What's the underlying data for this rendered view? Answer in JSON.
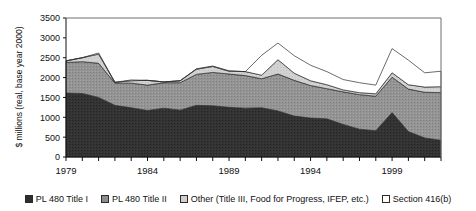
{
  "chart_data": {
    "type": "area",
    "stacked": true,
    "title": "",
    "xlabel": "",
    "ylabel": "$ millions (real, base year 2000)",
    "ylim": [
      0,
      3500
    ],
    "ytick_step": 500,
    "yticks": [
      "0",
      "500",
      "1000",
      "1500",
      "2000",
      "2500",
      "3000",
      "3500"
    ],
    "xticks_labeled": [
      "1979",
      "1984",
      "1989",
      "1994",
      "1999"
    ],
    "grid": false,
    "legend_position": "bottom",
    "x": [
      1979,
      1980,
      1981,
      1982,
      1983,
      1984,
      1985,
      1986,
      1987,
      1988,
      1989,
      1990,
      1991,
      1992,
      1993,
      1994,
      1995,
      1996,
      1997,
      1998,
      1999,
      2000,
      2001,
      2002
    ],
    "series": [
      {
        "name": "PL 480 Title I",
        "color": "#2e2e2e",
        "values": [
          1610,
          1600,
          1500,
          1300,
          1240,
          1170,
          1230,
          1180,
          1300,
          1290,
          1250,
          1230,
          1240,
          1160,
          1030,
          980,
          960,
          820,
          700,
          660,
          1120,
          640,
          480,
          420
        ]
      },
      {
        "name": "PL 480 Title II",
        "color": "#8d8d8d",
        "values": [
          770,
          800,
          860,
          560,
          620,
          640,
          640,
          690,
          780,
          840,
          840,
          820,
          730,
          930,
          900,
          820,
          760,
          820,
          870,
          870,
          890,
          1070,
          1150,
          1200
        ]
      },
      {
        "name": "Other (Title III, Food for Progress, IFEP, etc.)",
        "color": "#cfcfcf",
        "values": [
          40,
          100,
          230,
          20,
          60,
          120,
          20,
          50,
          130,
          150,
          70,
          100,
          90,
          360,
          180,
          120,
          100,
          50,
          50,
          60,
          110,
          110,
          130,
          150
        ]
      },
      {
        "name": "Section 416(b)",
        "color": "#ffffff",
        "values": [
          0,
          0,
          30,
          0,
          20,
          0,
          0,
          0,
          10,
          10,
          10,
          0,
          500,
          420,
          440,
          390,
          330,
          260,
          250,
          220,
          610,
          620,
          360,
          390
        ]
      }
    ]
  },
  "legend": {
    "items": [
      {
        "label": "PL 480 Title I",
        "swatch": "sw-t1"
      },
      {
        "label": "PL 480 Title II",
        "swatch": "sw-t2"
      },
      {
        "label": "Other (Title III, Food for Progress, IFEP, etc.)",
        "swatch": "sw-ot"
      },
      {
        "label": "Section 416(b)",
        "swatch": "sw-416"
      }
    ]
  }
}
